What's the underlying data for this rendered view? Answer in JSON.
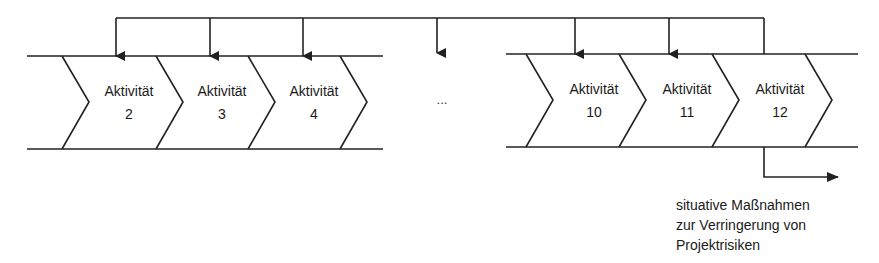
{
  "diagram": {
    "title": "",
    "colors": {
      "stroke": "#222222",
      "text": "#1a1a1a",
      "background": "#ffffff"
    },
    "activities_left": [
      {
        "label": "Aktivität",
        "number": "2"
      },
      {
        "label": "Aktivität",
        "number": "3"
      },
      {
        "label": "Aktivität",
        "number": "4"
      }
    ],
    "gap": {
      "label": "..."
    },
    "activities_right": [
      {
        "label": "Aktivität",
        "number": "10"
      },
      {
        "label": "Aktivität",
        "number": "11"
      },
      {
        "label": "Aktivität",
        "number": "12"
      }
    ],
    "feedback_loop": {
      "from": "Aktivität 12",
      "to": [
        "2",
        "3",
        "4",
        "...",
        "10",
        "11"
      ]
    },
    "output_note": {
      "lines": [
        "situative Maßnahmen",
        "zur Verringerung von",
        "Projektrisiken"
      ]
    }
  }
}
